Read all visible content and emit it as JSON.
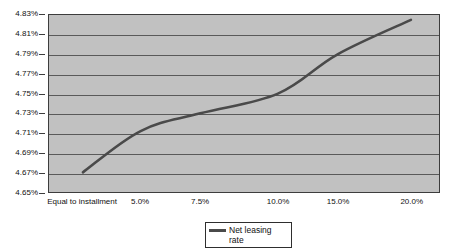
{
  "chart_data": {
    "type": "line",
    "title": "",
    "xlabel": "",
    "ylabel": "",
    "categories": [
      "Equal to installment",
      "5.0%",
      "7.5%",
      "10.0%",
      "15.0%",
      "20.0%"
    ],
    "x_tick_labels": [
      "Equal to installment",
      "5.0%",
      "7.5%",
      "10.0%",
      "15.0%",
      "20.0%"
    ],
    "y_tick_labels": [
      "4.65%",
      "4.67%",
      "4.69%",
      "4.71%",
      "4.73%",
      "4.75%",
      "4.77%",
      "4.79%",
      "4.81%",
      "4.83%"
    ],
    "y_tick_values": [
      4.65,
      4.67,
      4.69,
      4.71,
      4.73,
      4.75,
      4.77,
      4.79,
      4.81,
      4.83
    ],
    "ylim": [
      4.65,
      4.83
    ],
    "grid": true,
    "legend_position": "bottom",
    "series": [
      {
        "name": "Net leasing rate",
        "color": "#4a4a4a",
        "values": [
          4.67,
          4.712,
          4.73,
          4.75,
          4.79,
          4.825
        ],
        "points": [
          {
            "x": "Equal to installment",
            "y": 4.67
          },
          {
            "x": "5.0%",
            "y": 4.712
          },
          {
            "x": "7.5%",
            "y": 4.73
          },
          {
            "x": "10.0%",
            "y": 4.75
          },
          {
            "x": "15.0%",
            "y": 4.79
          },
          {
            "x": "20.0%",
            "y": 4.825
          }
        ]
      }
    ],
    "plot_background_color": "#c1c1c1",
    "gridline_color": "#5a5a5a",
    "axis_color": "#3d3d3d"
  },
  "legend": {
    "entries": [
      {
        "label": "Net leasing rate",
        "color": "#4a4a4a"
      }
    ]
  }
}
